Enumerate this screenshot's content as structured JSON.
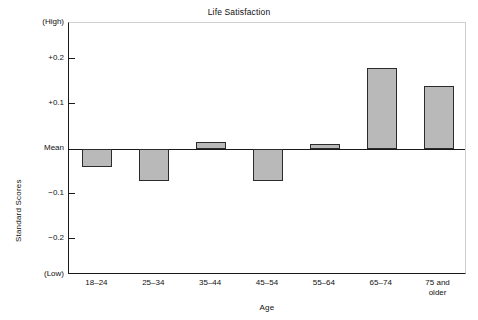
{
  "chart_data": {
    "type": "bar",
    "title": "Life Satisfaction",
    "xlabel": "Age",
    "ylabel": "Standard Scores",
    "categories": [
      "18–24",
      "25–34",
      "35–44",
      "45–54",
      "55–64",
      "65–74",
      "75 and\nolder"
    ],
    "category_lines": [
      [
        "18–24"
      ],
      [
        "25–34"
      ],
      [
        "35–44"
      ],
      [
        "45–54"
      ],
      [
        "55–64"
      ],
      [
        "65–74"
      ],
      [
        "75 and",
        "older"
      ]
    ],
    "values": [
      -0.04,
      -0.07,
      0.015,
      -0.07,
      0.012,
      0.18,
      0.14
    ],
    "ylim": [
      -0.28,
      0.28
    ],
    "ytick_values": [
      0.28,
      0.2,
      0.1,
      0.0,
      -0.1,
      -0.2,
      -0.28
    ],
    "ytick_labels": [
      "(High)",
      "+0.2",
      "+0.1",
      "Mean",
      "−0.1",
      "−0.2",
      "(Low)"
    ],
    "baseline_label": "Mean",
    "baseline_value": 0,
    "grid": false,
    "legend": null,
    "bar_color": "#b9b9b9",
    "bar_edge_color": "#2b2b2b",
    "axis_color": "#1a1a1a",
    "background_color": "#ffffff"
  },
  "figure": {
    "title": "Life Satisfaction",
    "xlabel": "Age",
    "ylabel": "Standard Scores"
  }
}
